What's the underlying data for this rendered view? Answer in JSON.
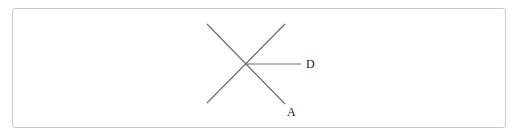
{
  "diagram": {
    "type": "geometry",
    "colors": {
      "line": "#6e6e6e",
      "frame": "#c9c9c9",
      "label": "#222222",
      "background": "#ffffff"
    },
    "intersection": {
      "x": 246,
      "y": 64
    },
    "lines": [
      {
        "name": "diagonal-descending",
        "x1": 207,
        "y1": 24,
        "x2": 285,
        "y2": 104
      },
      {
        "name": "diagonal-ascending",
        "x1": 285,
        "y1": 24,
        "x2": 207,
        "y2": 103
      },
      {
        "name": "ray-horizontal",
        "x1": 246,
        "y1": 64,
        "x2": 301,
        "y2": 64
      }
    ],
    "labels": [
      {
        "id": "D",
        "text": "D",
        "x": 306,
        "y": 58
      },
      {
        "id": "A",
        "text": "A",
        "x": 287,
        "y": 106
      }
    ]
  }
}
